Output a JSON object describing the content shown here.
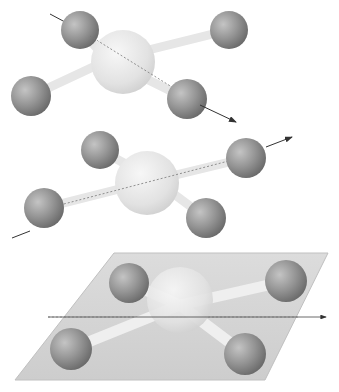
{
  "diagram": {
    "colors": {
      "background": "#ffffff",
      "central_atom": "#e4e4e4",
      "ligand_atom": "#8e8e8e",
      "bond": "#e8e8e8",
      "axis": "#333333",
      "plane": "#d8d8d8"
    },
    "panels": [
      {
        "id": "top",
        "element": "C2 axis through two opposite ligands (upper-left to lower-right)",
        "center": [
          108,
          60
        ],
        "ligands": [
          [
            80,
            30
          ],
          [
            229,
            30
          ],
          [
            31,
            96
          ],
          [
            187,
            99
          ]
        ],
        "axis": [
          [
            50,
            14
          ],
          [
            236,
            122
          ]
        ]
      },
      {
        "id": "middle",
        "element": "C2 axis through two opposite ligands (lower-left to upper-right)",
        "center": [
          147,
          180
        ],
        "ligands": [
          [
            100,
            150
          ],
          [
            246,
            158
          ],
          [
            44,
            208
          ],
          [
            206,
            218
          ]
        ],
        "axis": [
          [
            12,
            238
          ],
          [
            292,
            137
          ]
        ]
      },
      {
        "id": "bottom",
        "element": "Horizontal mirror plane containing molecule with C2' axis",
        "center": [
          180,
          305
        ],
        "ligands": [
          [
            129,
            283
          ],
          [
            286,
            281
          ],
          [
            71,
            349
          ],
          [
            245,
            354
          ]
        ],
        "axis": [
          [
            48,
            317
          ],
          [
            326,
            317
          ]
        ],
        "plane": [
          [
            114,
            253
          ],
          [
            328,
            253
          ],
          [
            265,
            380
          ],
          [
            15,
            380
          ]
        ]
      }
    ]
  }
}
